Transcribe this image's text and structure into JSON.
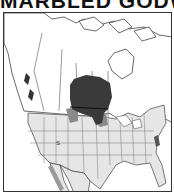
{
  "title": "MARBLED GODW",
  "map": {
    "region": "North America",
    "legend": {
      "breeding_color": "#3a3a3a",
      "migration_color": "#8a8a8a",
      "land_us_color": "#e6e6e6",
      "land_canada_color": "#ffffff",
      "border_color": "#555555"
    },
    "labels": [
      "S"
    ]
  }
}
